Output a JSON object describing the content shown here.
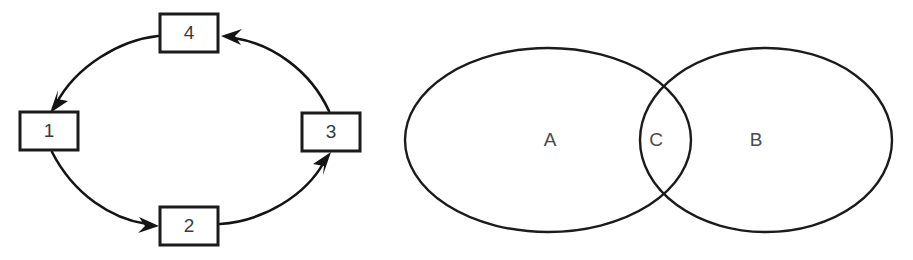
{
  "figure": {
    "background_color": "#ffffff",
    "stroke_color": "#1b1b1b",
    "text_color": "#3a3a3a",
    "panels": [
      {
        "name": "cycle-diagram",
        "type": "cyclic-flow-diagram",
        "nodes": [
          {
            "id": "node-4",
            "label": "4",
            "position": "top",
            "x": 189,
            "y": 33,
            "width": 58,
            "height": 38
          },
          {
            "id": "node-1",
            "label": "1",
            "position": "left",
            "x": 49,
            "y": 131,
            "width": 58,
            "height": 38
          },
          {
            "id": "node-2",
            "label": "2",
            "position": "bottom",
            "x": 189,
            "y": 226,
            "width": 58,
            "height": 38
          },
          {
            "id": "node-3",
            "label": "3",
            "position": "right",
            "x": 331,
            "y": 132,
            "width": 58,
            "height": 38
          }
        ],
        "edges": [
          {
            "id": "edge-4-1",
            "from": "4",
            "to": "1",
            "direction": "top-to-left"
          },
          {
            "id": "edge-1-2",
            "from": "1",
            "to": "2",
            "direction": "left-to-bottom"
          },
          {
            "id": "edge-2-3",
            "from": "2",
            "to": "3",
            "direction": "bottom-to-right"
          },
          {
            "id": "edge-3-4",
            "from": "3",
            "to": "4",
            "direction": "right-to-top"
          }
        ]
      },
      {
        "name": "venn-diagram",
        "type": "two-set-venn-diagram",
        "regions": [
          {
            "id": "region-a",
            "label": "A",
            "role": "left-set-only",
            "x": 550,
            "y": 141
          },
          {
            "id": "region-c",
            "label": "C",
            "role": "intersection",
            "x": 656,
            "y": 141
          },
          {
            "id": "region-b",
            "label": "B",
            "role": "right-set-only",
            "x": 756,
            "y": 141
          }
        ],
        "ellipses": [
          {
            "id": "ellipse-a",
            "cx": 548,
            "cy": 140,
            "rx": 143,
            "ry": 92
          },
          {
            "id": "ellipse-b",
            "cx": 766,
            "cy": 140,
            "rx": 126,
            "ry": 92
          }
        ]
      }
    ]
  }
}
